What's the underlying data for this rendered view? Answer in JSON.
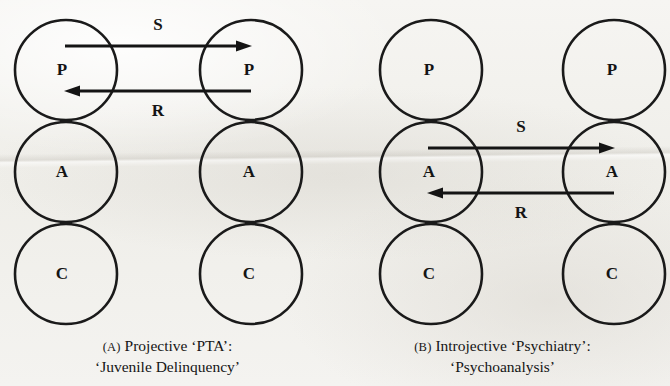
{
  "figure": {
    "background_color": "#f3f2ef",
    "ink_color": "#141414",
    "panels": [
      {
        "id": "A",
        "tag": "(A)",
        "caption_line1": "Projective ‘PTA’:",
        "caption_line2": "‘Juvenile Delinquency’",
        "columns": [
          {
            "id": "left",
            "nodes": [
              "P",
              "A",
              "C"
            ]
          },
          {
            "id": "right",
            "nodes": [
              "P",
              "A",
              "C"
            ]
          }
        ],
        "arrows": [
          {
            "label": "S",
            "direction": "left-to-right",
            "row": "P",
            "label_position": "above"
          },
          {
            "label": "R",
            "direction": "right-to-left",
            "row": "P",
            "label_position": "below"
          }
        ]
      },
      {
        "id": "B",
        "tag": "(B)",
        "caption_line1": "Introjective ‘Psychiatry’:",
        "caption_line2": "‘Psychoanalysis’",
        "columns": [
          {
            "id": "left",
            "nodes": [
              "P",
              "A",
              "C"
            ]
          },
          {
            "id": "right",
            "nodes": [
              "P",
              "A",
              "C"
            ]
          }
        ],
        "arrows": [
          {
            "label": "S",
            "direction": "left-to-right",
            "row": "A",
            "label_position": "above"
          },
          {
            "label": "R",
            "direction": "right-to-left",
            "row": "A",
            "label_position": "below"
          }
        ]
      }
    ],
    "node_labels": {
      "a_left_top": "P",
      "a_left_mid": "A",
      "a_left_bot": "C",
      "a_right_top": "P",
      "a_right_mid": "A",
      "a_right_bot": "C",
      "b_left_top": "P",
      "b_left_mid": "A",
      "b_left_bot": "C",
      "b_right_top": "P",
      "b_right_mid": "A",
      "b_right_bot": "C"
    },
    "edge_labels": {
      "a_stimulus": "S",
      "a_response": "R",
      "b_stimulus": "S",
      "b_response": "R"
    }
  }
}
